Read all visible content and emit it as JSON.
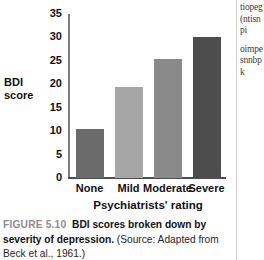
{
  "chart_data": {
    "type": "bar",
    "title": "",
    "categories": [
      "None",
      "Mild",
      "Moderate",
      "Severe"
    ],
    "values": [
      10.5,
      19.5,
      25.3,
      30.0
    ],
    "series": [
      {
        "name": "BDI score",
        "values": [
          10.5,
          19.5,
          25.3,
          30.0
        ]
      }
    ],
    "xlabel": "Psychiatrists' rating",
    "ylabel": "BDI score",
    "ylim": [
      0,
      35
    ],
    "yticks": [
      0,
      5,
      10,
      15,
      20,
      25,
      30,
      35
    ],
    "ytick_labels": [
      "0",
      "5",
      "10",
      "15",
      "20",
      "25",
      "30",
      "35"
    ],
    "grid": false,
    "legend": "none",
    "bar_colors": [
      "#6b6b6b",
      "#a6a6a6",
      "#8a8a8a",
      "#4d4d4d"
    ]
  },
  "axis": {
    "y_title_line1": "BDI",
    "y_title_line2": "score",
    "x_title": "Psychiatrists' rating"
  },
  "caption": {
    "figure_number": "FIGURE 5.10",
    "title": "BDI scores broken down by severity of depression.",
    "source": "(Source: Adapted from Beck et al., 1961.)"
  },
  "adjacent_column": {
    "paragraph1": "tiopeg(ntisnpi",
    "paragraph2": "oimpesnnbpk"
  }
}
